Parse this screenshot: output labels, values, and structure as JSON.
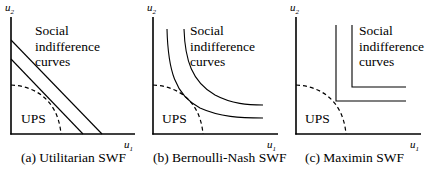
{
  "figure": {
    "panels": [
      {
        "id": "a",
        "caption": "(a) Utilitarian SWF",
        "y_axis_label": "u",
        "y_axis_sub": "2",
        "x_axis_label": "u",
        "x_axis_sub": "1",
        "curves_label": [
          "Social",
          "indifference",
          "curves"
        ],
        "region_label": "UPS",
        "curve_type": "straight lines"
      },
      {
        "id": "b",
        "caption": "(b) Bernoulli-Nash SWF",
        "y_axis_label": "u",
        "y_axis_sub": "2",
        "x_axis_label": "u",
        "x_axis_sub": "1",
        "curves_label": [
          "Social",
          "indifference",
          "curves"
        ],
        "region_label": "UPS",
        "curve_type": "hyperbolas"
      },
      {
        "id": "c",
        "caption": "(c) Maximin SWF",
        "y_axis_label": "u",
        "y_axis_sub": "2",
        "x_axis_label": "u",
        "x_axis_sub": "1",
        "curves_label": [
          "Social",
          "indifference",
          "curves"
        ],
        "region_label": "UPS",
        "curve_type": "L-shaped"
      }
    ]
  }
}
